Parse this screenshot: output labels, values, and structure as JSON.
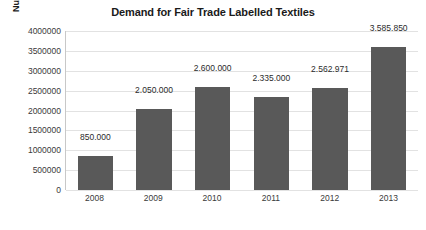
{
  "chart_data": {
    "type": "bar",
    "title": "Demand for Fair Trade Labelled Textiles",
    "xlabel": "",
    "ylabel": "Number of Sold Items",
    "categories": [
      "2008",
      "2009",
      "2010",
      "2011",
      "2012",
      "2013"
    ],
    "values": [
      850000,
      2050000,
      2600000,
      2335000,
      2562971,
      3585850
    ],
    "value_labels": [
      "850.000",
      "2.050.000",
      "2.600.000",
      "2.335.000",
      "2.562.971",
      "3.585.850"
    ],
    "ylim": [
      0,
      4000000
    ],
    "ytick_values": [
      0,
      500000,
      1000000,
      1500000,
      2000000,
      2500000,
      3000000,
      3500000,
      4000000
    ],
    "ytick_labels": [
      "0",
      "500000",
      "1000000",
      "1500000",
      "2000000",
      "2500000",
      "3000000",
      "3500000",
      "4000000"
    ],
    "grid": true,
    "legend": false,
    "bar_color": "#595959",
    "gridline_color": "#e2e2e2",
    "axis_color": "#c8c8c8",
    "background_color": "#ffffff"
  }
}
